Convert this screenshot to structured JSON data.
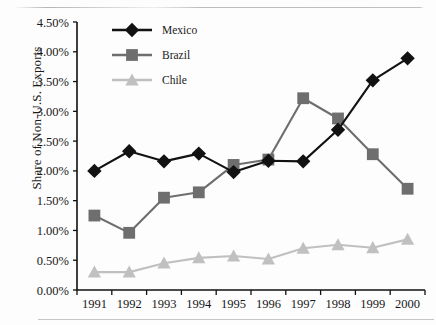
{
  "figure": {
    "y_axis_title": "Share of Non-U.S. Exports"
  },
  "chart_data": {
    "type": "line",
    "title": "",
    "subtitle": "",
    "xlabel": "",
    "ylabel": "Share of Non-U.S. Exports",
    "categories": [
      "1991",
      "1992",
      "1993",
      "1994",
      "1995",
      "1996",
      "1997",
      "1998",
      "1999",
      "2000"
    ],
    "x_tick_labels": [
      "1991",
      "1992",
      "1993",
      "1994",
      "1995",
      "1996",
      "1997",
      "1998",
      "1999",
      "2000"
    ],
    "y_tick_labels": [
      "0.00%",
      "0.50%",
      "1.00%",
      "1.50%",
      "2.00%",
      "2.50%",
      "3.00%",
      "3.50%",
      "4.00%",
      "4.50%"
    ],
    "y_tick_values": [
      0.0,
      0.5,
      1.0,
      1.5,
      2.0,
      2.5,
      3.0,
      3.5,
      4.0,
      4.5
    ],
    "ylim": [
      0.0,
      4.5
    ],
    "y_unit": "%",
    "grid": false,
    "legend_position": "top-left-inside",
    "series": [
      {
        "name": "Mexico",
        "marker": "diamond",
        "color": "#121212",
        "values": [
          2.0,
          2.33,
          2.16,
          2.29,
          1.98,
          2.17,
          2.16,
          2.69,
          3.52,
          3.89
        ]
      },
      {
        "name": "Brazil",
        "marker": "square",
        "color": "#6e6e6e",
        "values": [
          1.25,
          0.96,
          1.55,
          1.64,
          2.1,
          2.19,
          3.22,
          2.88,
          2.28,
          1.7
        ]
      },
      {
        "name": "Chile",
        "marker": "triangle",
        "color": "#c0c0c0",
        "values": [
          0.3,
          0.3,
          0.45,
          0.54,
          0.57,
          0.52,
          0.7,
          0.76,
          0.71,
          0.85
        ]
      }
    ]
  }
}
